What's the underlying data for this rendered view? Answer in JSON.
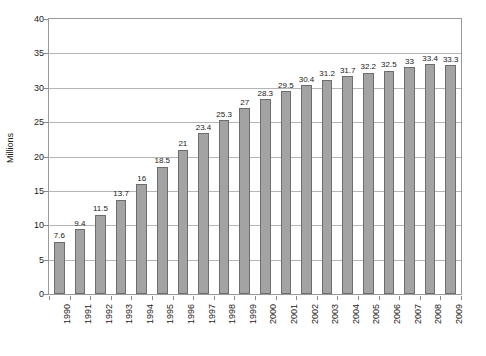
{
  "chart_data": {
    "type": "bar",
    "title": "",
    "subtitle": "",
    "xlabel": "",
    "ylabel": "Millions",
    "ylim": [
      0,
      40
    ],
    "xlim": null,
    "grid": true,
    "legend": false,
    "legend_position": "none",
    "y_ticks": [
      0,
      5,
      10,
      15,
      20,
      25,
      30,
      35,
      40
    ],
    "y_tick_labels": [
      "0",
      "5",
      "10",
      "15",
      "20",
      "25",
      "30",
      "35",
      "40"
    ],
    "categories": [
      "1990",
      "1991",
      "1992",
      "1993",
      "1994",
      "1995",
      "1996",
      "1997",
      "1998",
      "1999",
      "2000",
      "2001",
      "2002",
      "2003",
      "2004",
      "2005",
      "2006",
      "2007",
      "2008",
      "2009"
    ],
    "values": [
      7.6,
      9.4,
      11.5,
      13.7,
      16,
      18.5,
      21,
      23.4,
      25.3,
      27,
      28.3,
      29.5,
      30.4,
      31.2,
      31.7,
      32.2,
      32.5,
      33,
      33.4,
      33.3
    ],
    "data_labels": [
      "7.6",
      "9.4",
      "11.5",
      "13.7",
      "16",
      "18.5",
      "21",
      "23.4",
      "25.3",
      "27",
      "28.3",
      "29.5",
      "30.4",
      "31.2",
      "31.7",
      "32.2",
      "32.5",
      "33",
      "33.4",
      "33.3"
    ],
    "bar_color": "#a3a3a3",
    "bar_border_color": "#6d6d6d",
    "gridline_color": "#b5b5b5",
    "axis_color": "#9a9a9a",
    "text_color": "#1a1a1a",
    "background_color": "#ffffff"
  }
}
